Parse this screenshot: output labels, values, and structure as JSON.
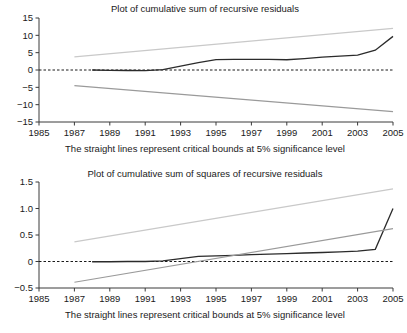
{
  "chart_data": [
    {
      "id": "cusum",
      "type": "line",
      "title": "Plot of cumulative sum of recursive residuals",
      "caption": "The straight lines represent critical bounds at 5% significance level",
      "xlabel": "",
      "ylabel": "",
      "xlim": [
        1985,
        2005
      ],
      "ylim": [
        -15,
        15
      ],
      "xticks": [
        1985,
        1987,
        1989,
        1991,
        1993,
        1995,
        1997,
        1999,
        2001,
        2003,
        2005
      ],
      "yticks": [
        -15,
        -10,
        -5,
        0,
        5,
        10,
        15
      ],
      "xtick_labels": [
        "1985",
        "1987",
        "1989",
        "1991",
        "1993",
        "1995",
        "1997",
        "1999",
        "2001",
        "2003",
        "2005"
      ],
      "ytick_labels": [
        "15",
        "10",
        "5",
        "0",
        "−5",
        "−10",
        "−15"
      ],
      "grid": false,
      "legend": "none",
      "zero_reference_line": 0,
      "series": [
        {
          "name": "CUSUM",
          "color": "#2b2b2b",
          "style": "solid",
          "x": [
            1988,
            1989,
            1990,
            1991,
            1992,
            1993,
            1994,
            1995,
            1996,
            1997,
            1998,
            1999,
            2000,
            2001,
            2002,
            2003,
            2004,
            2005
          ],
          "values": [
            0.0,
            -0.1,
            -0.15,
            -0.2,
            0.1,
            1.1,
            2.1,
            3.0,
            3.05,
            3.05,
            3.05,
            2.95,
            3.3,
            3.7,
            4.0,
            4.3,
            5.7,
            9.7
          ]
        },
        {
          "name": "Upper critical bound (5%)",
          "color": "#c9c9c9",
          "style": "solid",
          "x": [
            1987,
            2005
          ],
          "values": [
            3.8,
            12.0
          ]
        },
        {
          "name": "Lower critical bound (5%)",
          "color": "#9a9a9a",
          "style": "solid",
          "x": [
            1987,
            2005
          ],
          "values": [
            -4.5,
            -12.0
          ]
        }
      ]
    },
    {
      "id": "cusumsq",
      "type": "line",
      "title": "Plot of cumulative sum of squares of recursive residuals",
      "caption": "The straight lines represent critical bounds at 5% significance level",
      "xlabel": "",
      "ylabel": "",
      "xlim": [
        1985,
        2005
      ],
      "ylim": [
        -0.5,
        1.5
      ],
      "xticks": [
        1985,
        1987,
        1989,
        1991,
        1993,
        1995,
        1997,
        1999,
        2001,
        2003,
        2005
      ],
      "yticks": [
        -0.5,
        0,
        0.5,
        1.0,
        1.5
      ],
      "xtick_labels": [
        "1985",
        "1987",
        "1989",
        "1991",
        "1993",
        "1995",
        "1997",
        "1999",
        "2001",
        "2003",
        "2005"
      ],
      "ytick_labels": [
        "1.5",
        "1.0",
        "0.5",
        "0",
        "−0.5"
      ],
      "grid": false,
      "legend": "none",
      "zero_reference_line": 0,
      "series": [
        {
          "name": "CUSUM of squares",
          "color": "#2b2b2b",
          "style": "solid",
          "x": [
            1988,
            1989,
            1990,
            1991,
            1992,
            1993,
            1994,
            1995,
            1996,
            1997,
            1998,
            1999,
            2000,
            2001,
            2002,
            2003,
            2004,
            2005
          ],
          "values": [
            -0.005,
            -0.005,
            0.0,
            0.0,
            0.01,
            0.055,
            0.095,
            0.105,
            0.115,
            0.13,
            0.14,
            0.15,
            0.16,
            0.17,
            0.18,
            0.195,
            0.23,
            1.0
          ]
        },
        {
          "name": "Upper critical bound (5%)",
          "color": "#c9c9c9",
          "style": "solid",
          "x": [
            1987,
            2005
          ],
          "values": [
            0.37,
            1.37
          ]
        },
        {
          "name": "Lower critical bound (5%)",
          "color": "#6e6e6e",
          "style": "solid",
          "x": [
            1987,
            2005
          ],
          "values": [
            -0.39,
            0.62
          ]
        }
      ]
    }
  ],
  "figure": {
    "background": "#ffffff",
    "axis_color": "#3a3a3a",
    "text_color": "#1a1a1a"
  }
}
